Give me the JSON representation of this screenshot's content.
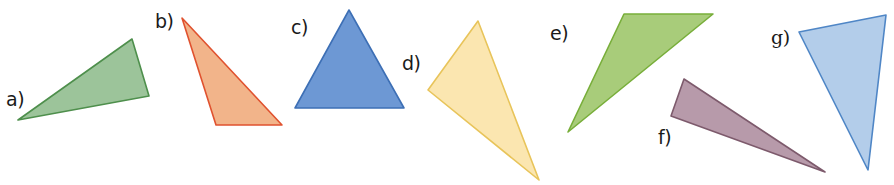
{
  "figure": {
    "width": 894,
    "height": 185,
    "background": "#ffffff",
    "triangles": [
      {
        "id": "a",
        "label": "a)",
        "label_pos": [
          6,
          90
        ],
        "points": [
          [
            18,
            120
          ],
          [
            132,
            39
          ],
          [
            149,
            96
          ]
        ],
        "fill": "#9cc49a",
        "stroke": "#4e8f4c"
      },
      {
        "id": "b",
        "label": "b)",
        "label_pos": [
          155,
          12
        ],
        "points": [
          [
            182,
            18
          ],
          [
            216,
            125
          ],
          [
            282,
            125
          ]
        ],
        "fill": "#f2b48a",
        "stroke": "#e0522f"
      },
      {
        "id": "c",
        "label": "c)",
        "label_pos": [
          291,
          18
        ],
        "points": [
          [
            349,
            10
          ],
          [
            295,
            108
          ],
          [
            404,
            108
          ]
        ],
        "fill": "#6d98d4",
        "stroke": "#3d6fb5"
      },
      {
        "id": "d",
        "label": "d)",
        "label_pos": [
          402,
          54
        ],
        "points": [
          [
            478,
            21
          ],
          [
            428,
            90
          ],
          [
            539,
            180
          ]
        ],
        "fill": "#fbe6b0",
        "stroke": "#e8c45a"
      },
      {
        "id": "e",
        "label": "e)",
        "label_pos": [
          550,
          24
        ],
        "points": [
          [
            624,
            14
          ],
          [
            713,
            14
          ],
          [
            568,
            132
          ]
        ],
        "fill": "#a8cc7a",
        "stroke": "#78ae3a"
      },
      {
        "id": "f",
        "label": "f)",
        "label_pos": [
          658,
          128
        ],
        "points": [
          [
            684,
            79
          ],
          [
            671,
            116
          ],
          [
            825,
            172
          ]
        ],
        "fill": "#b79aaa",
        "stroke": "#7d5a6c"
      },
      {
        "id": "g",
        "label": "g)",
        "label_pos": [
          771,
          28
        ],
        "points": [
          [
            799,
            32
          ],
          [
            886,
            15
          ],
          [
            868,
            170
          ]
        ],
        "fill": "#b3cdea",
        "stroke": "#4f86c6"
      }
    ]
  }
}
